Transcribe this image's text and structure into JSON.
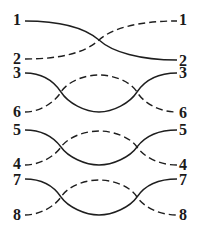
{
  "diagram": {
    "type": "wire-crossing-pairs",
    "pairs": [
      {
        "name": "pair-1-2",
        "left_labels": [
          "1",
          "2"
        ],
        "right_labels": [
          "1",
          "2"
        ],
        "solid_from": "1",
        "solid_to": "2",
        "dashed_from": "2",
        "dashed_to": "1",
        "crossings": 1
      },
      {
        "name": "pair-3-6",
        "left_labels": [
          "3",
          "6"
        ],
        "right_labels": [
          "3",
          "6"
        ],
        "solid_from": "3",
        "solid_to": "3",
        "dashed_from": "6",
        "dashed_to": "6",
        "crossings": 2
      },
      {
        "name": "pair-5-4",
        "left_labels": [
          "5",
          "4"
        ],
        "right_labels": [
          "5",
          "4"
        ],
        "solid_from": "5",
        "solid_to": "5",
        "dashed_from": "4",
        "dashed_to": "4",
        "crossings": 2
      },
      {
        "name": "pair-7-8",
        "left_labels": [
          "7",
          "8"
        ],
        "right_labels": [
          "7",
          "8"
        ],
        "solid_from": "7",
        "solid_to": "7",
        "dashed_from": "8",
        "dashed_to": "8",
        "crossings": 2
      }
    ],
    "line_color": "#1e1e1e",
    "label_color": "#1a1a1a"
  }
}
